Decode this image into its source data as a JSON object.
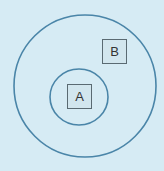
{
  "diagram": {
    "background": "#d6ebf4",
    "stroke_color": "#4a85a8",
    "outer_circle": {
      "cx": 85,
      "cy": 86,
      "r": 71
    },
    "inner_circle": {
      "cx": 79,
      "cy": 97,
      "rx": 29,
      "ry": 28
    },
    "boxes": [
      {
        "label": "A",
        "x": 67,
        "y": 84,
        "w": 25,
        "h": 25
      },
      {
        "label": "B",
        "x": 102,
        "y": 39,
        "w": 25,
        "h": 25
      }
    ]
  }
}
